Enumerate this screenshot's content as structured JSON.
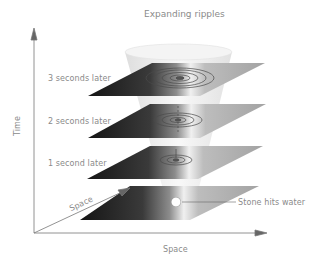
{
  "title": "Expanding ripples",
  "axes": {
    "vertical_label": "Time",
    "depth_label": "Space",
    "horizontal_label": "Space"
  },
  "layers": [
    {
      "label": "3 seconds later",
      "ripple_rings": 5
    },
    {
      "label": "2 seconds later",
      "ripple_rings": 3
    },
    {
      "label": "1 second later",
      "ripple_rings": 2
    },
    {
      "label": "",
      "ripple_rings": 0
    }
  ],
  "annotation": {
    "label": "Stone hits water"
  },
  "colors": {
    "axis": "#777777",
    "text": "#8a8a8a",
    "plane_dark": "#1e1e1e",
    "plane_light": "#f2f2f2",
    "plane_mid": "#9a9a9a",
    "cone": "#e8e8e8"
  }
}
